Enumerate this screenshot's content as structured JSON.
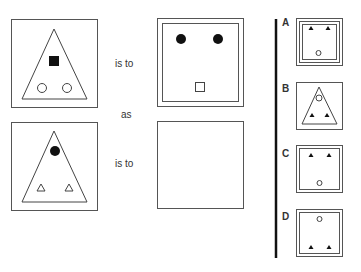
{
  "puzzle": {
    "connector_top": "is to",
    "connector_middle": "as",
    "connector_bottom": "is to",
    "figures": {
      "top_left": "Square frame containing a triangle with a filled square above two open circles",
      "top_right": "Double-bordered square with two filled circles at top and an open square at bottom",
      "bottom_left": "Square frame containing a triangle with a filled circle above two open triangles",
      "bottom_right": "Empty square (answer to find)"
    }
  },
  "options": [
    {
      "label": "A",
      "description": "Triple-bordered square, two filled triangles at top, open circle at bottom"
    },
    {
      "label": "B",
      "description": "Square containing triangle with open circle at top and two filled triangles at bottom"
    },
    {
      "label": "C",
      "description": "Double-bordered square, two filled triangles at top, open circle at bottom"
    },
    {
      "label": "D",
      "description": "Double-bordered square, open circle at top, two filled triangles at bottom"
    }
  ]
}
